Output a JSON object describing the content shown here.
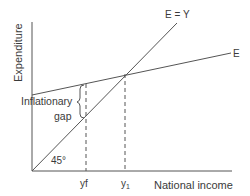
{
  "diagram": {
    "title": "Inflationary gap",
    "axes": {
      "y_label": "Expenditure",
      "x_label": "National income"
    },
    "lines": {
      "e_equals_y_label": "E = Y",
      "e_label": "E"
    },
    "annotations": {
      "gap_label_line1": "Inflationary",
      "gap_label_line2": "gap",
      "angle_label": "45°",
      "yf_label": "yf",
      "y1_label": "y",
      "y1_subscript": "1"
    },
    "colors": {
      "line": "#555555",
      "text": "#3a3a3a",
      "background": "#ffffff"
    }
  }
}
